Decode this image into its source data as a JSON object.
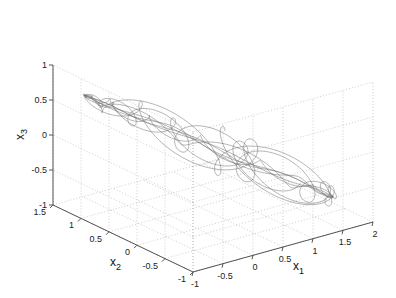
{
  "chart_data": {
    "type": "line3d",
    "title": "",
    "xlabel": "x1",
    "ylabel": "x2",
    "zlabel": "x3",
    "xlim": [
      -1,
      2
    ],
    "ylim": [
      -1,
      1.5
    ],
    "zlim": [
      -1,
      1
    ],
    "x_ticks": [
      "-1",
      "-0.5",
      "0",
      "0.5",
      "1",
      "1.5",
      "2"
    ],
    "y_ticks": [
      "-1",
      "-0.5",
      "0",
      "0.5",
      "1",
      "1.5"
    ],
    "z_ticks": [
      "-1",
      "-0.5",
      "0",
      "0.5",
      "1"
    ],
    "grid": true,
    "line_color": "#6e6e6e",
    "legend": null,
    "series": [
      {
        "name": "trajectory",
        "approx_extent": {
          "x1": [
            -0.8,
            1.8
          ],
          "x2": [
            -0.6,
            1.2
          ],
          "x3": [
            -0.8,
            0.6
          ]
        }
      }
    ]
  },
  "axes": {
    "x1": {
      "label": "x",
      "sub": "1",
      "ticks": [
        "-1",
        "-0.5",
        "0",
        "0.5",
        "1",
        "1.5",
        "2"
      ]
    },
    "x2": {
      "label": "x",
      "sub": "2",
      "ticks": [
        "1.5",
        "1",
        "0.5",
        "0",
        "-0.5",
        "-1"
      ]
    },
    "x3": {
      "label": "x",
      "sub": "3",
      "ticks": [
        "1",
        "0.5",
        "0",
        "-0.5",
        "-1"
      ]
    }
  }
}
